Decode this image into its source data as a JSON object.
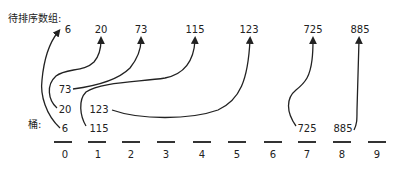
{
  "title": "待排序数组:",
  "bucket_label": "桶:",
  "array": [
    {
      "value": "6",
      "x": 64
    },
    {
      "value": "20",
      "x": 101
    },
    {
      "value": "73",
      "x": 141
    },
    {
      "value": "115",
      "x": 195
    },
    {
      "value": "123",
      "x": 249
    },
    {
      "value": "725",
      "x": 313
    },
    {
      "value": "885",
      "x": 360
    }
  ],
  "buckets": [
    {
      "index": "0",
      "x": 65,
      "items": [
        {
          "value": "6",
          "y": 124
        },
        {
          "value": "20",
          "y": 104
        },
        {
          "value": "73",
          "y": 85
        }
      ]
    },
    {
      "index": "1",
      "x": 98,
      "items": [
        {
          "value": "115",
          "y": 124
        },
        {
          "value": "123",
          "y": 104
        }
      ]
    },
    {
      "index": "2",
      "x": 131,
      "items": []
    },
    {
      "index": "3",
      "x": 166,
      "items": []
    },
    {
      "index": "4",
      "x": 202,
      "items": []
    },
    {
      "index": "5",
      "x": 237,
      "items": []
    },
    {
      "index": "6",
      "x": 273,
      "items": []
    },
    {
      "index": "7",
      "x": 307,
      "items": [
        {
          "value": "725",
          "y": 124
        }
      ]
    },
    {
      "index": "8",
      "x": 342,
      "items": [
        {
          "value": "885",
          "y": 124
        }
      ]
    },
    {
      "index": "9",
      "x": 377,
      "items": []
    }
  ]
}
